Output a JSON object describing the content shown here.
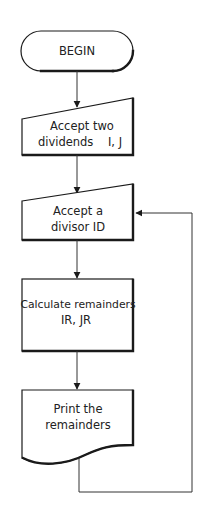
{
  "diagram": {
    "type": "flowchart",
    "nodes": [
      {
        "id": "begin",
        "shape": "terminator",
        "lines": [
          "BEGIN"
        ]
      },
      {
        "id": "accept-dividends",
        "shape": "manual-input",
        "lines": [
          "Accept two",
          "dividends    I, J"
        ]
      },
      {
        "id": "accept-divisor",
        "shape": "manual-input",
        "lines": [
          "Accept a",
          "divisor ID"
        ]
      },
      {
        "id": "calculate",
        "shape": "process",
        "lines": [
          "Calculate remainders",
          "IR, JR"
        ]
      },
      {
        "id": "print",
        "shape": "document",
        "lines": [
          "Print the",
          "remainders"
        ]
      }
    ],
    "edges": [
      {
        "from": "begin",
        "to": "accept-dividends"
      },
      {
        "from": "accept-dividends",
        "to": "accept-divisor"
      },
      {
        "from": "accept-divisor",
        "to": "calculate"
      },
      {
        "from": "calculate",
        "to": "print"
      },
      {
        "from": "print",
        "to": "accept-divisor",
        "type": "loop-back"
      }
    ],
    "colors": {
      "stroke": "#1a1a1a",
      "background": "#ffffff"
    }
  }
}
